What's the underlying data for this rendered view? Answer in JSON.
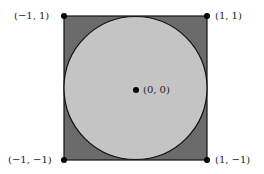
{
  "diagram": {
    "square": {
      "fill": "#6b6b6b",
      "stroke": "#111111"
    },
    "circle": {
      "fill": "#c4c4c4",
      "stroke": "#111111"
    },
    "points": [
      {
        "id": "top-left",
        "label": "(−1,  1)"
      },
      {
        "id": "top-right",
        "label": "(1,  1)"
      },
      {
        "id": "bottom-left",
        "label": "(−1, −1)"
      },
      {
        "id": "bottom-right",
        "label": "(1, −1)"
      },
      {
        "id": "center",
        "label": "(0,  0)"
      }
    ]
  }
}
